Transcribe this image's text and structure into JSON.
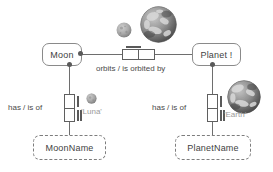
{
  "diagram": {
    "background_color": "#ffffff",
    "line_color": "#6e6e6e"
  },
  "entities": [
    {
      "id": "moon",
      "label": "Moon",
      "type": "entity-type"
    },
    {
      "id": "planet",
      "label": "Planet !",
      "type": "entity-type"
    }
  ],
  "value_types": [
    {
      "id": "moonname",
      "label": "MoonName",
      "style": "dashed"
    },
    {
      "id": "planetname",
      "label": "PlanetName",
      "style": "dashed"
    }
  ],
  "fact_types": [
    {
      "id": "orbits",
      "predicate": "orbits / is orbited by",
      "orientation": "horizontal",
      "roles": 2,
      "uniqueness": "left-role"
    },
    {
      "id": "moon-has-name",
      "predicate": "has / is of",
      "orientation": "vertical",
      "roles": 2,
      "uniqueness": "both-roles"
    },
    {
      "id": "planet-has-name",
      "predicate": "has / is of",
      "orientation": "vertical",
      "roles": 2,
      "uniqueness": "both-roles"
    }
  ],
  "sample_values": [
    {
      "id": "luna",
      "label": "'Luna'",
      "color": "#9a9a9a"
    },
    {
      "id": "earth",
      "label": "'Earth'",
      "color": "#9a9a9a"
    }
  ],
  "images": [
    {
      "id": "moon-orb-top",
      "alt": "moon-image",
      "size": 16,
      "kind": "moon"
    },
    {
      "id": "earth-orb-top",
      "alt": "earth-image",
      "size": 37,
      "kind": "earth"
    },
    {
      "id": "moon-orb-small",
      "alt": "moon-image",
      "size": 11,
      "kind": "moon"
    },
    {
      "id": "earth-orb-right",
      "alt": "earth-image",
      "size": 34,
      "kind": "earth"
    }
  ],
  "colors": {
    "stroke": "#6e6e6e",
    "box_stroke": "#5f5f5f",
    "text": "#3f3f3f",
    "muted_text": "#9a9a9a",
    "moon_fill": "#a9a9a9",
    "earth_fill": "#6d6d6d"
  }
}
